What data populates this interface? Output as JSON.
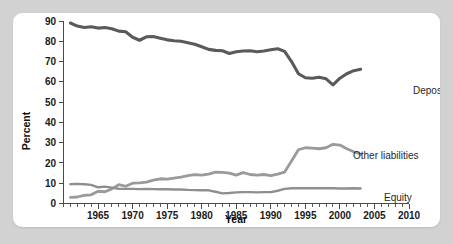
{
  "chart_data": {
    "type": "line",
    "title": "",
    "xlabel": "Year",
    "ylabel": "Percent",
    "xlim": [
      1960,
      2010
    ],
    "ylim": [
      0,
      90
    ],
    "xticks": [
      1965,
      1970,
      1975,
      1980,
      1985,
      1990,
      1995,
      2000,
      2005,
      2010
    ],
    "xticklabels": [
      "1965",
      "1970",
      "1975",
      "1980",
      "1985",
      "1990",
      "1995",
      "2000",
      "2005",
      "2010"
    ],
    "yticks": [
      0,
      10,
      20,
      30,
      40,
      50,
      60,
      70,
      80,
      90
    ],
    "yticklabels": [
      "0",
      "10",
      "20",
      "30",
      "40",
      "50",
      "60",
      "70",
      "80",
      "90"
    ],
    "minor_xtick_interval": 1,
    "grid": false,
    "legend_position": "right-inline-labels",
    "x": [
      1961,
      1962,
      1963,
      1964,
      1965,
      1966,
      1967,
      1968,
      1969,
      1970,
      1971,
      1972,
      1973,
      1974,
      1975,
      1976,
      1977,
      1978,
      1979,
      1980,
      1981,
      1982,
      1983,
      1984,
      1985,
      1986,
      1987,
      1988,
      1989,
      1990,
      1991,
      1992,
      1993,
      1994,
      1995,
      1996,
      1997,
      1998,
      1999,
      2000,
      2001,
      2002,
      2003
    ],
    "series": [
      {
        "name": "Deposits",
        "color": "#5a5a5a",
        "label_color": "#1f1f1f",
        "values": [
          89.0,
          87.5,
          86.8,
          87.2,
          86.5,
          86.8,
          86.2,
          85.0,
          84.7,
          82.0,
          80.5,
          82.2,
          82.3,
          81.5,
          80.7,
          80.3,
          80.0,
          79.3,
          78.5,
          77.3,
          76.0,
          75.5,
          75.3,
          74.0,
          74.8,
          75.2,
          75.3,
          74.8,
          75.2,
          75.8,
          76.3,
          75.0,
          70.0,
          64.0,
          62.0,
          61.8,
          62.3,
          61.5,
          58.5,
          61.8,
          64.0,
          65.5,
          66.2
        ]
      },
      {
        "name": "Other liabilities",
        "color": "#9a9a9a",
        "label_color": "#1f1f1f",
        "values": [
          3.0,
          3.2,
          4.0,
          4.3,
          6.0,
          5.8,
          7.2,
          9.3,
          8.5,
          10.0,
          10.2,
          10.5,
          11.5,
          12.2,
          12.0,
          12.5,
          13.0,
          13.8,
          14.2,
          14.0,
          14.5,
          15.5,
          15.3,
          15.0,
          14.0,
          15.2,
          14.3,
          14.0,
          14.3,
          13.8,
          14.5,
          15.5,
          21.0,
          26.5,
          27.5,
          27.3,
          27.0,
          27.5,
          29.2,
          28.8,
          27.0,
          25.5,
          24.3
        ]
      },
      {
        "name": "Equity",
        "color": "#8f8f8f",
        "label_color": "#1f1f1f",
        "values": [
          9.5,
          9.7,
          9.5,
          9.2,
          8.0,
          8.3,
          7.8,
          7.3,
          7.2,
          7.2,
          7.1,
          7.2,
          7.1,
          7.0,
          7.0,
          6.9,
          6.9,
          6.7,
          6.6,
          6.5,
          6.5,
          5.8,
          5.0,
          5.2,
          5.5,
          5.6,
          5.6,
          5.5,
          5.6,
          5.6,
          6.3,
          7.2,
          7.5,
          7.5,
          7.6,
          7.5,
          7.5,
          7.6,
          7.5,
          7.4,
          7.4,
          7.5,
          7.4
        ]
      }
    ],
    "series_labels": [
      {
        "text": "Deposits",
        "series": "Deposits"
      },
      {
        "text": "Other liabilities",
        "series": "Other liabilities"
      },
      {
        "text": "Equity",
        "series": "Equity"
      }
    ]
  },
  "colors": {
    "page_background": "#d2d2d2",
    "card_background": "#ffffff",
    "axis": "#4a4a4a",
    "text": "#1a1a1a"
  }
}
